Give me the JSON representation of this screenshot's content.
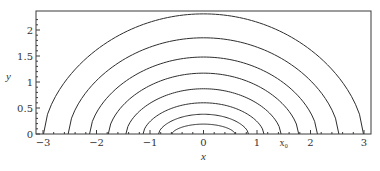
{
  "chart_data": {
    "type": "line",
    "title": "",
    "xlabel": "x",
    "ylabel": "y",
    "xlim": [
      -3.1,
      3.15
    ],
    "ylim": [
      0,
      2.37
    ],
    "grid": false,
    "legend": null,
    "x_ticks": [
      -3,
      -2,
      -1,
      0,
      1,
      2,
      3
    ],
    "x_tick_labels": [
      "−3",
      "−2",
      "−1",
      "0",
      "1",
      "2",
      "3"
    ],
    "y_ticks": [
      0,
      0.5,
      1,
      1.5,
      2
    ],
    "y_tick_labels": [
      "0",
      "0.5",
      "1",
      "1.5",
      "2"
    ],
    "annotations": [
      {
        "text": "x₀",
        "x": 1.5,
        "position": "below x-axis"
      }
    ],
    "series": [
      {
        "name": "curve-1",
        "half_width": 0.59,
        "height": 0.19
      },
      {
        "name": "curve-2",
        "half_width": 0.84,
        "height": 0.38
      },
      {
        "name": "curve-3",
        "half_width": 1.13,
        "height": 0.6
      },
      {
        "name": "curve-4",
        "half_width": 1.45,
        "height": 0.87
      },
      {
        "name": "curve-5",
        "half_width": 1.78,
        "height": 1.17
      },
      {
        "name": "curve-6",
        "half_width": 2.13,
        "height": 1.48
      },
      {
        "name": "curve-7",
        "half_width": 2.53,
        "height": 1.85
      },
      {
        "name": "curve-8",
        "half_width": 2.99,
        "height": 2.31
      }
    ]
  },
  "layout": {
    "x_origin_px": 203.5,
    "x_scale_px": 53.5,
    "y_origin_px": 134,
    "y_scale_px": 52,
    "frame": {
      "left": 36,
      "right": 371,
      "top": 11,
      "bottom": 134
    }
  }
}
